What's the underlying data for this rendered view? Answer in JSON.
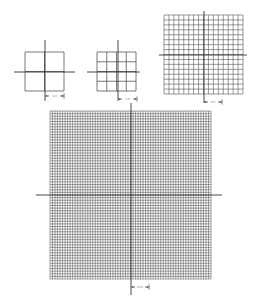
{
  "figure": {
    "line_color": "#555555",
    "axis_color": "#333333",
    "background": "#ffffff"
  },
  "grids": [
    {
      "id": "grid-2x2",
      "x": 25,
      "y": 52,
      "w": 39,
      "h": 39,
      "cols": 2,
      "rows": 2,
      "h_axis": {
        "y": 72,
        "x1": 14,
        "x2": 75
      },
      "v_axis": {
        "x": 45,
        "y1": 40,
        "y2": 101
      },
      "scale": {
        "x1": 45,
        "x2": 64,
        "y": 96,
        "label": "1.0"
      }
    },
    {
      "id": "grid-4x4",
      "x": 97,
      "y": 52,
      "w": 39,
      "h": 39,
      "cols": 4,
      "rows": 4,
      "h_axis": {
        "y": 72,
        "x1": 87,
        "x2": 140
      },
      "v_axis": {
        "x": 118,
        "y1": 40,
        "y2": 101
      },
      "scale": {
        "x1": 118,
        "x2": 137,
        "y": 99,
        "label": "1.0"
      }
    },
    {
      "id": "grid-16x16",
      "x": 164,
      "y": 15,
      "w": 79,
      "h": 79,
      "cols": 16,
      "rows": 16,
      "h_axis": {
        "y": 55,
        "x1": 159,
        "x2": 247
      },
      "v_axis": {
        "x": 204,
        "y1": 11,
        "y2": 103
      },
      "scale": {
        "x1": 204,
        "x2": 222,
        "y": 102,
        "label": "0.5"
      }
    },
    {
      "id": "grid-64x64",
      "x": 50,
      "y": 111,
      "w": 161,
      "h": 168,
      "cols": 64,
      "rows": 64,
      "h_axis": {
        "y": 195,
        "x1": 36,
        "x2": 222
      },
      "v_axis": {
        "x": 131,
        "y1": 103,
        "y2": 295
      },
      "scale": {
        "x1": 131,
        "x2": 149,
        "y": 287,
        "label": "0.25"
      }
    }
  ]
}
